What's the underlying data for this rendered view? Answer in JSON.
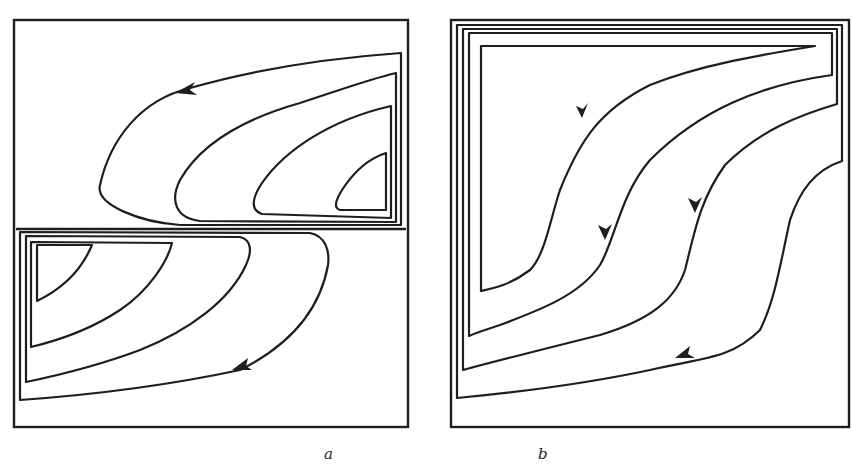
{
  "figure": {
    "panels": [
      {
        "id": "a",
        "label": "a",
        "description": "Two stacked rectangular cells with counter-rotating nested closed streamlines forming an S pattern; arrows indicate counterclockwise-left flow in top cell and leftward-down flow in bottom cell"
      },
      {
        "id": "b",
        "label": "b",
        "description": "Single square cell with nested closed streamlines forming S-shaped curves from top-right to bottom-left; arrows indicate downward/leftward flow"
      }
    ],
    "colors": {
      "line": "#1e1e1e",
      "background": "#ffffff"
    }
  }
}
